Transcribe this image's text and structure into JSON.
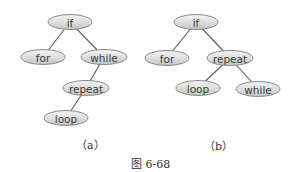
{
  "figure": {
    "caption": "图 6-68",
    "trees": [
      {
        "label": "（a）",
        "nodes": [
          {
            "id": "if",
            "text": "if",
            "x": 70,
            "y": 22,
            "w": 44
          },
          {
            "id": "for",
            "text": "for",
            "x": 43,
            "y": 57,
            "w": 44
          },
          {
            "id": "while",
            "text": "while",
            "x": 104,
            "y": 57,
            "w": 46
          },
          {
            "id": "repeat",
            "text": "repeat",
            "x": 86,
            "y": 88,
            "w": 46
          },
          {
            "id": "loop",
            "text": "loop",
            "x": 66,
            "y": 118,
            "w": 44
          }
        ],
        "edges": [
          [
            "if",
            "for"
          ],
          [
            "if",
            "while"
          ],
          [
            "while",
            "repeat"
          ],
          [
            "repeat",
            "loop"
          ]
        ]
      },
      {
        "label": "（b）",
        "nodes": [
          {
            "id": "if",
            "text": "if",
            "x": 196,
            "y": 22,
            "w": 44
          },
          {
            "id": "for",
            "text": "for",
            "x": 167,
            "y": 58,
            "w": 44
          },
          {
            "id": "repeat",
            "text": "repeat",
            "x": 230,
            "y": 58,
            "w": 46
          },
          {
            "id": "loop",
            "text": "loop",
            "x": 198,
            "y": 88,
            "w": 44
          },
          {
            "id": "while",
            "text": "while",
            "x": 258,
            "y": 89,
            "w": 44
          }
        ],
        "edges": [
          [
            "if",
            "for"
          ],
          [
            "if",
            "repeat"
          ],
          [
            "repeat",
            "loop"
          ],
          [
            "repeat",
            "while"
          ]
        ]
      }
    ]
  }
}
